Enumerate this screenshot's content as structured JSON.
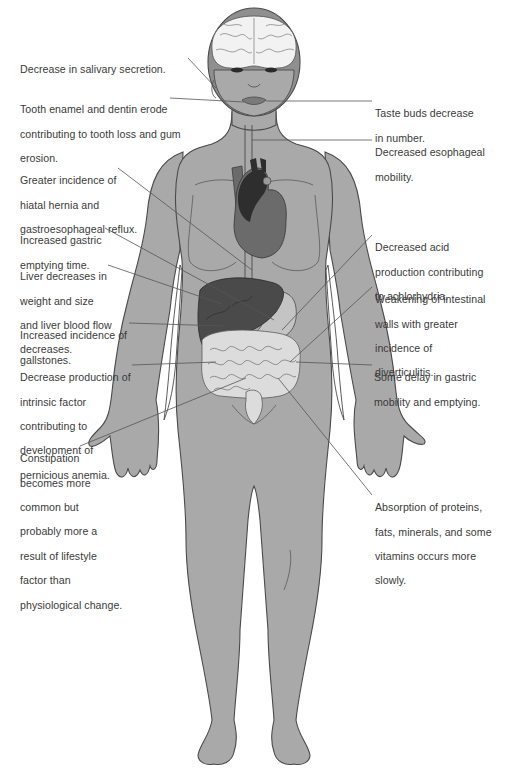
{
  "diagram": {
    "colors": {
      "background": "#ffffff",
      "skin": "#a9a9a9",
      "skin_outline": "#4a4a4a",
      "hair": "#8f8f8f",
      "brain": "#f2f2f2",
      "heart_dark": "#2e2e2e",
      "heart_mid": "#6b6b6b",
      "liver": "#4a4a4a",
      "intestine": "#dcdcdc",
      "stomach": "#c4c4c4",
      "leader_line": "#555555",
      "text": "#3a3a3a"
    }
  },
  "labels": {
    "left": [
      {
        "id": "salivary",
        "lines": [
          "Decrease in salivary secretion."
        ]
      },
      {
        "id": "tooth",
        "lines": [
          "Tooth enamel and dentin erode",
          "contributing to tooth loss and gum",
          "erosion."
        ]
      },
      {
        "id": "hiatal",
        "lines": [
          "Greater incidence of",
          "hiatal hernia and",
          "gastroesophageal reflux."
        ]
      },
      {
        "id": "gastric_emptying",
        "lines": [
          "Increased gastric",
          "emptying time."
        ]
      },
      {
        "id": "liver",
        "lines": [
          "Liver decreases in",
          "weight and size",
          "and liver blood flow",
          "decreases."
        ]
      },
      {
        "id": "gallstones",
        "lines": [
          "Increased incidence of",
          "gallstones."
        ]
      },
      {
        "id": "intrinsic_factor",
        "lines": [
          "Decrease production of",
          "intrinsic factor",
          "contributing to",
          "development of",
          "pernicious anemia."
        ]
      },
      {
        "id": "constipation",
        "lines": [
          "Constipation",
          "becomes more",
          "common but",
          "probably more a",
          "result of lifestyle",
          "factor than",
          "physiological change."
        ]
      }
    ],
    "right": [
      {
        "id": "taste_buds",
        "lines": [
          "Taste buds decrease",
          "in number."
        ]
      },
      {
        "id": "esophageal",
        "lines": [
          "Decreased esophageal",
          "mobility."
        ]
      },
      {
        "id": "acid",
        "lines": [
          "Decreased acid",
          "production contributing",
          "to achlorhydria."
        ]
      },
      {
        "id": "intestinal_walls",
        "lines": [
          "Weakening of intestinal",
          "walls with greater",
          "incidence of",
          "diverticulitis."
        ]
      },
      {
        "id": "gastric_delay",
        "lines": [
          "Some delay in gastric",
          "mobility and emptying."
        ]
      },
      {
        "id": "absorption",
        "lines": [
          "Absorption of proteins,",
          "fats, minerals, and some",
          "vitamins occurs more",
          "slowly."
        ]
      }
    ]
  }
}
